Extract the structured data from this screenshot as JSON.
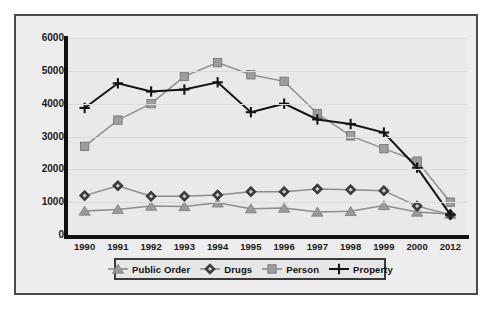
{
  "chart_data": {
    "type": "line",
    "title": "",
    "xlabel": "",
    "ylabel": "",
    "categories": [
      "1990",
      "1991",
      "1992",
      "1993",
      "1994",
      "1995",
      "1996",
      "1997",
      "1998",
      "1999",
      "2000",
      "2012"
    ],
    "ylim": [
      0,
      6000
    ],
    "yticks": [
      0,
      1000,
      2000,
      3000,
      4000,
      5000,
      6000
    ],
    "ytick_labels": [
      "0",
      "1000",
      "2000",
      "3000",
      "4000",
      "5000",
      "6000"
    ],
    "grid": true,
    "legend_position": "bottom",
    "series": [
      {
        "name": "Public Order",
        "marker": "triangle",
        "color": "#9a9a9a",
        "line_color": "#8c8c8c",
        "values": [
          730,
          780,
          880,
          870,
          980,
          800,
          820,
          700,
          720,
          900,
          700,
          640
        ]
      },
      {
        "name": "Drugs",
        "marker": "diamond",
        "color": "#3c3c3c",
        "line_color": "#8c8c8c",
        "values": [
          1200,
          1500,
          1180,
          1180,
          1220,
          1320,
          1320,
          1400,
          1380,
          1350,
          880,
          620
        ]
      },
      {
        "name": "Person",
        "marker": "square",
        "color": "#9d9d9d",
        "line_color": "#8f8f8f",
        "values": [
          2700,
          3500,
          4000,
          4830,
          5250,
          4880,
          4680,
          3700,
          3020,
          2630,
          2250,
          1000
        ]
      },
      {
        "name": "Property",
        "marker": "plus",
        "color": "#141414",
        "line_color": "#141414",
        "values": [
          3870,
          4620,
          4370,
          4430,
          4650,
          3740,
          4000,
          3520,
          3380,
          3120,
          2050,
          620
        ]
      }
    ]
  },
  "legend": {
    "items": [
      {
        "label": "Public Order",
        "marker": "triangle-marker-icon"
      },
      {
        "label": "Drugs",
        "marker": "diamond-marker-icon"
      },
      {
        "label": "Person",
        "marker": "square-marker-icon"
      },
      {
        "label": "Property",
        "marker": "plus-marker-icon"
      }
    ]
  }
}
